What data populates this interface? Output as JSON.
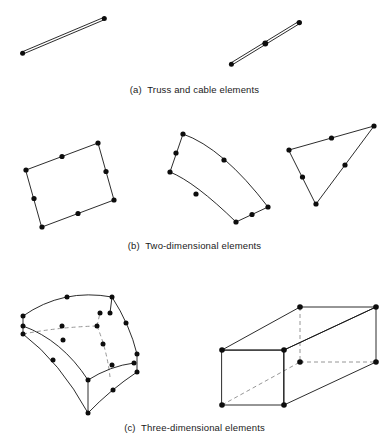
{
  "figure": {
    "background_color": "#ffffff",
    "line_color": "#141414",
    "hidden_line_color": "#8a8a8a",
    "node_color": "#0d0d0d"
  },
  "panels": [
    {
      "key": "a",
      "caption": "(a)  Truss and cable elements",
      "elements": [
        {
          "name": "two-node-truss-element",
          "node_count": 2,
          "nodes": [
            [
              22,
              52
            ],
            [
              105,
              18
            ]
          ]
        },
        {
          "name": "three-node-cable-element",
          "node_count": 3,
          "nodes": [
            [
              232,
              64
            ],
            [
              265,
              43
            ],
            [
              300,
              22
            ]
          ]
        }
      ]
    },
    {
      "key": "b",
      "caption": "(b)  Two-dimensional elements",
      "elements": [
        {
          "name": "eight-node-quadrilateral-element",
          "node_count": 8,
          "nodes": [
            [
              27,
              66
            ],
            [
              63,
              51
            ],
            [
              98,
              38
            ],
            [
              106,
              66
            ],
            [
              114,
              95
            ],
            [
              76,
              110
            ],
            [
              40,
              124
            ],
            [
              33,
              95
            ]
          ]
        },
        {
          "name": "curved-eight-node-quadrilateral-element",
          "node_count": 8,
          "nodes": [
            [
              184,
              22
            ],
            [
              180,
              40
            ],
            [
              173,
              58
            ],
            [
              78,
              0
            ],
            [
              0,
              0
            ],
            [
              0,
              0
            ],
            [
              0,
              0
            ],
            [
              0,
              0
            ]
          ]
        },
        {
          "name": "six-node-triangular-element",
          "node_count": 6,
          "nodes": [
            [
              290,
              40
            ],
            [
              331,
              27
            ],
            [
              374,
              15
            ],
            [
              347,
              52
            ],
            [
              320,
              90
            ],
            [
              305,
              65
            ]
          ]
        }
      ]
    },
    {
      "key": "c",
      "caption": "(c)  Three-dimensional elements",
      "elements": [
        {
          "name": "curved-twenty-node-hexahedral-element",
          "node_count": 20
        },
        {
          "name": "eight-node-rectangular-solid-element",
          "node_count": 8
        }
      ]
    }
  ]
}
